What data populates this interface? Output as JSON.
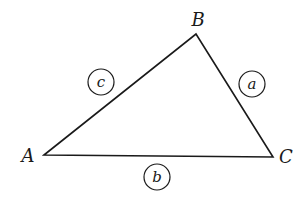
{
  "diagram": {
    "type": "triangle",
    "vertices": [
      {
        "name": "A",
        "x": 44,
        "y": 155,
        "label_x": 28,
        "label_y": 162
      },
      {
        "name": "B",
        "x": 196,
        "y": 34,
        "label_x": 198,
        "label_y": 26
      },
      {
        "name": "C",
        "x": 273,
        "y": 157,
        "label_x": 286,
        "label_y": 163
      }
    ],
    "sides": [
      {
        "name": "a",
        "between": [
          "B",
          "C"
        ],
        "circle_x": 252,
        "circle_y": 84,
        "r": 13
      },
      {
        "name": "b",
        "between": [
          "A",
          "C"
        ],
        "circle_x": 157,
        "circle_y": 177,
        "r": 13
      },
      {
        "name": "c",
        "between": [
          "A",
          "B"
        ],
        "circle_x": 101,
        "circle_y": 82,
        "r": 13
      }
    ],
    "colors": {
      "ink": "#1a1a1a",
      "background": "#ffffff"
    }
  }
}
